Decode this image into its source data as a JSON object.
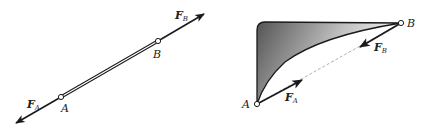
{
  "figure_left": {
    "description": "Two-force member (straight bar) with opposing forces",
    "point_a_label": "A",
    "point_b_label": "B",
    "force_a": {
      "symbol": "F",
      "subscript": "A"
    },
    "force_b": {
      "symbol": "F",
      "subscript": "B"
    }
  },
  "figure_right": {
    "description": "Curved two-force member (shaded plate) with forces along line AB",
    "point_a_label": "A",
    "point_b_label": "B",
    "force_a": {
      "symbol": "F",
      "subscript": "A"
    },
    "force_b": {
      "symbol": "F",
      "subscript": "B"
    }
  },
  "colors": {
    "line": "#1a1a1a",
    "shade_dark": "#5a5a5a",
    "shade_light": "#ffffff",
    "dashed": "#9a9a9a"
  }
}
